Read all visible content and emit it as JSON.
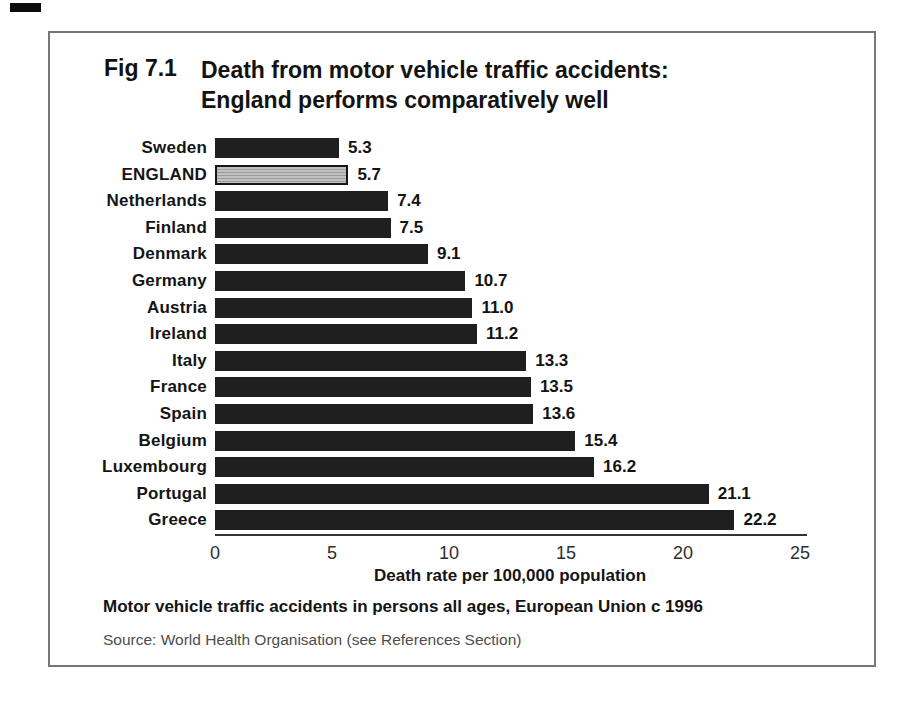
{
  "figure": {
    "label": "Fig 7.1",
    "title_line1": "Death from motor vehicle traffic accidents:",
    "title_line2": "England performs comparatively well",
    "caption": "Motor vehicle traffic accidents in persons all ages, European Union c 1996",
    "source": "Source: World Health Organisation (see References Section)"
  },
  "chart_data": {
    "type": "bar",
    "orientation": "horizontal",
    "title": "Death from motor vehicle traffic accidents: England performs comparatively well",
    "xlabel": "Death rate per 100,000 population",
    "ylabel": "",
    "categories": [
      "Sweden",
      "ENGLAND",
      "Netherlands",
      "Finland",
      "Denmark",
      "Germany",
      "Austria",
      "Ireland",
      "Italy",
      "France",
      "Spain",
      "Belgium",
      "Luxembourg",
      "Portugal",
      "Greece"
    ],
    "values": [
      5.3,
      5.7,
      7.4,
      7.5,
      9.1,
      10.7,
      11.0,
      11.2,
      13.3,
      13.5,
      13.6,
      15.4,
      16.2,
      21.1,
      22.2
    ],
    "value_labels": [
      "5.3",
      "5.7",
      "7.4",
      "7.5",
      "9.1",
      "10.7",
      "11.0",
      "11.2",
      "13.3",
      "13.5",
      "13.6",
      "15.4",
      "16.2",
      "21.1",
      "22.2"
    ],
    "highlight_category": "ENGLAND",
    "highlight_index": 1,
    "xlim": [
      0,
      25
    ],
    "xticks": [
      0,
      5,
      10,
      15,
      20,
      25
    ],
    "grid": false,
    "legend": false,
    "bar_color": "#1f1f1f",
    "highlight_bar_color": "#b5b5b5"
  }
}
